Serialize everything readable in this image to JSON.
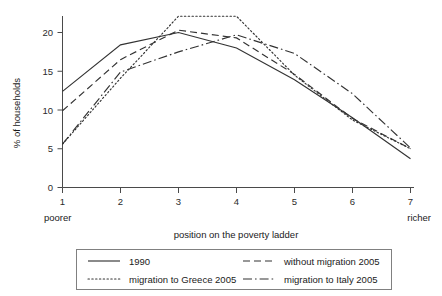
{
  "chart_data": {
    "type": "line",
    "title": "",
    "xlabel": "position on the poverty ladder",
    "ylabel": "% of households",
    "x": [
      1,
      2,
      3,
      4,
      5,
      6,
      7
    ],
    "xticklabels": [
      "1",
      "2",
      "3",
      "4",
      "5",
      "6",
      "7"
    ],
    "yticklabels": [
      "0",
      "5",
      "10",
      "15",
      "20"
    ],
    "yticks": [
      0,
      5,
      10,
      15,
      20
    ],
    "xlim": [
      1,
      7
    ],
    "ylim": [
      0,
      23
    ],
    "grid": false,
    "legend_position": "below",
    "x_axis_end_labels": {
      "left": "poorer",
      "right": "richer"
    },
    "series": [
      {
        "name": "1990",
        "dash": "solid",
        "values": [
          12.4,
          18.4,
          20.0,
          18.0,
          13.9,
          9.0,
          3.7
        ]
      },
      {
        "name": "without migration 2005",
        "dash": "dashed",
        "values": [
          9.9,
          16.5,
          20.3,
          19.3,
          14.6,
          8.9,
          5.0
        ]
      },
      {
        "name": "migration to Greece 2005",
        "dash": "dotted",
        "values": [
          5.6,
          14.1,
          22.1,
          22.1,
          14.5,
          8.7,
          5.0
        ]
      },
      {
        "name": "migration to Italy 2005",
        "dash": "dashdot",
        "values": [
          5.6,
          14.9,
          17.5,
          19.7,
          17.3,
          12.1,
          5.1
        ]
      }
    ]
  },
  "legend": {
    "entries": [
      {
        "label": "1990",
        "dash": "solid"
      },
      {
        "label": "without migration 2005",
        "dash": "dashed"
      },
      {
        "label": "migration to Greece 2005",
        "dash": "dotted"
      },
      {
        "label": "migration to Italy 2005",
        "dash": "dashdot"
      }
    ]
  },
  "colors": {
    "line": "#333333",
    "axis": "#4a4a4a",
    "text": "#1a1a1a",
    "legend_border": "#808080",
    "background": "#ffffff"
  }
}
